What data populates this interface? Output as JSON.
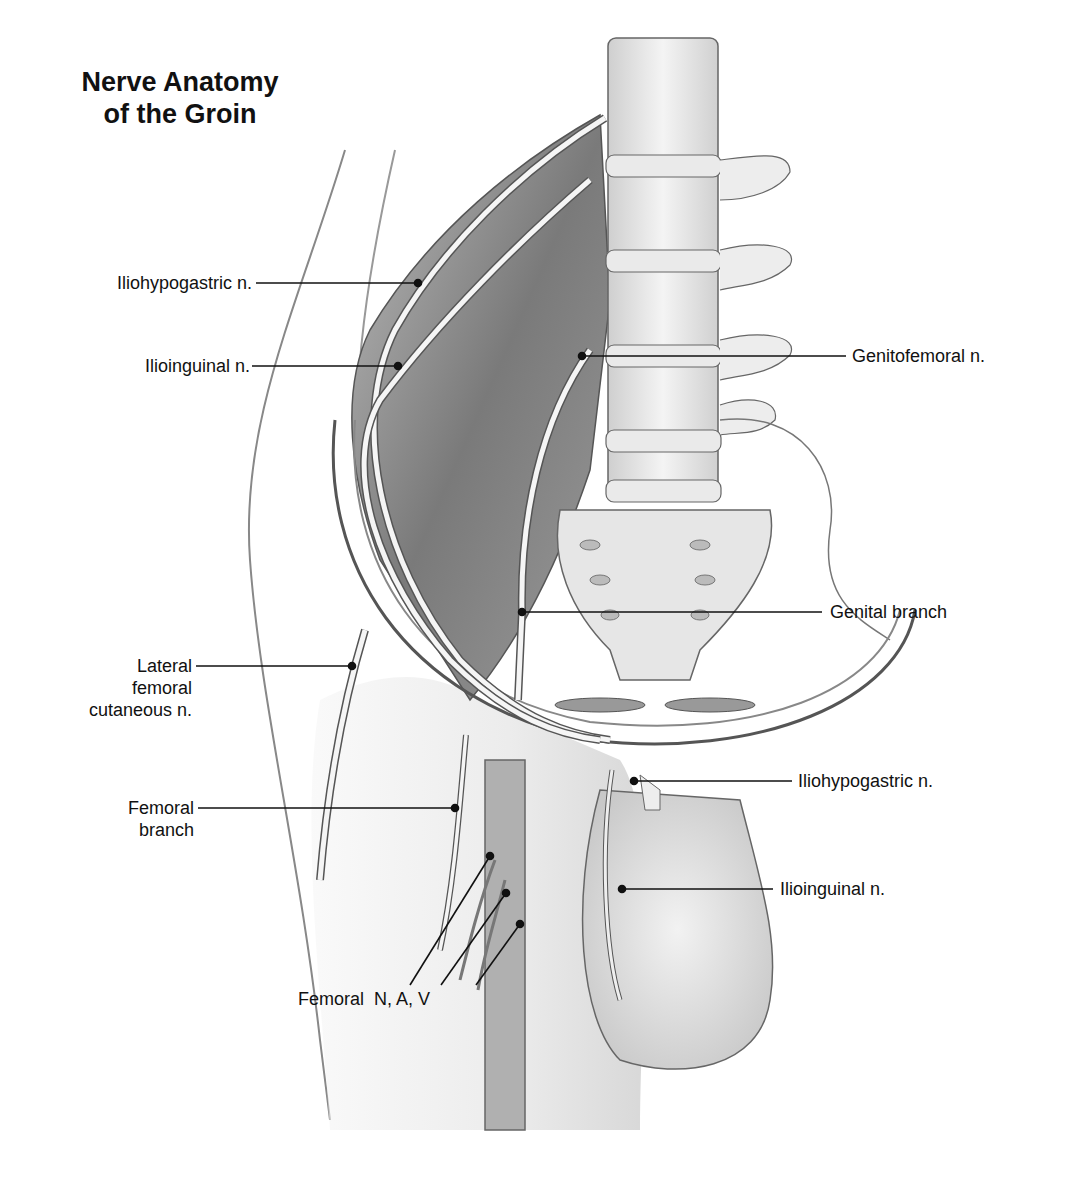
{
  "figure": {
    "title_line1": "Nerve Anatomy",
    "title_line2": "of the Groin"
  },
  "labels": {
    "iliohypogastric_upper": "Iliohypogastric n.",
    "ilioinguinal_upper": "Ilioinguinal n.",
    "genitofemoral": "Genitofemoral n.",
    "genital_branch": "Genital branch",
    "lateral_femoral_line1": "Lateral",
    "lateral_femoral_line2": "femoral",
    "lateral_femoral_line3": "cutaneous n.",
    "femoral_branch_line1": "Femoral",
    "femoral_branch_line2": "branch",
    "iliohypogastric_lower": "Iliohypogastric n.",
    "ilioinguinal_lower": "Ilioinguinal n.",
    "femoral_nav": "Femoral  N, A, V"
  },
  "colors": {
    "ink": "#111111",
    "shade_dark": "#6e6e6e",
    "shade_mid": "#a9a9a9",
    "shade_light": "#d9d9d9",
    "background": "#ffffff"
  }
}
